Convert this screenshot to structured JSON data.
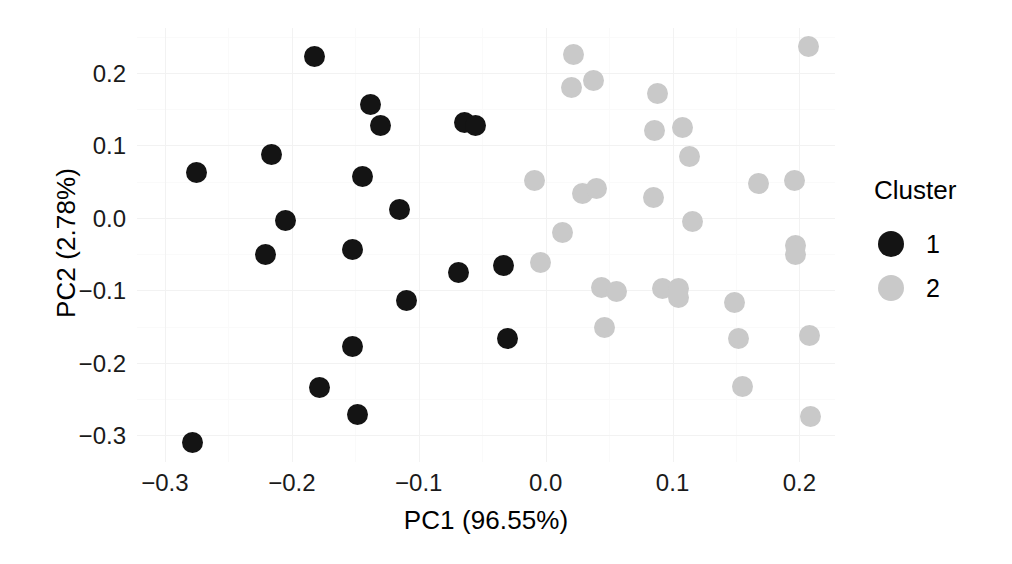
{
  "chart_data": {
    "type": "scatter",
    "title": "",
    "xlabel": "PC1 (96.55%)",
    "ylabel": "PC2 (2.78%)",
    "xlim": [
      -0.322,
      0.228
    ],
    "ylim": [
      -0.337,
      0.262
    ],
    "xticks": [
      "-0.3",
      "-0.2",
      "-0.1",
      "0.0",
      "0.1",
      "0.2"
    ],
    "xtick_values": [
      -0.3,
      -0.2,
      -0.1,
      0.0,
      0.1,
      0.2
    ],
    "yticks": [
      "0.2",
      "0.1",
      "0.0",
      "-0.1",
      "-0.2",
      "-0.3"
    ],
    "ytick_values": [
      0.2,
      0.1,
      0.0,
      -0.1,
      -0.2,
      -0.3
    ],
    "grid": true,
    "legend": {
      "title": "Cluster",
      "position": "right",
      "entries": [
        {
          "label": "1",
          "color": "#141414"
        },
        {
          "label": "2",
          "color": "#c9c9c9"
        }
      ]
    },
    "series": [
      {
        "name": "1",
        "color": "#141414",
        "points": [
          [
            -0.275,
            0.062
          ],
          [
            -0.216,
            0.088
          ],
          [
            -0.221,
            -0.051
          ],
          [
            -0.205,
            -0.004
          ],
          [
            -0.182,
            0.222
          ],
          [
            -0.178,
            -0.234
          ],
          [
            -0.152,
            -0.178
          ],
          [
            -0.148,
            -0.271
          ],
          [
            -0.152,
            -0.044
          ],
          [
            -0.138,
            0.157
          ],
          [
            -0.13,
            0.127
          ],
          [
            -0.144,
            0.057
          ],
          [
            -0.115,
            0.012
          ],
          [
            -0.11,
            -0.114
          ],
          [
            -0.064,
            0.132
          ],
          [
            -0.055,
            0.128
          ],
          [
            -0.069,
            -0.075
          ],
          [
            -0.033,
            -0.066
          ],
          [
            -0.03,
            -0.166
          ],
          [
            -0.278,
            -0.31
          ]
        ]
      },
      {
        "name": "2",
        "color": "#c9c9c9",
        "points": [
          [
            -0.009,
            0.051
          ],
          [
            -0.004,
            -0.061
          ],
          [
            0.013,
            -0.02
          ],
          [
            0.02,
            0.18
          ],
          [
            0.022,
            0.225
          ],
          [
            0.029,
            0.033
          ],
          [
            0.038,
            0.19
          ],
          [
            0.04,
            0.04
          ],
          [
            0.044,
            -0.096
          ],
          [
            0.056,
            -0.101
          ],
          [
            0.046,
            -0.152
          ],
          [
            0.088,
            0.172
          ],
          [
            0.086,
            0.12
          ],
          [
            0.085,
            0.028
          ],
          [
            0.092,
            -0.097
          ],
          [
            0.105,
            -0.098
          ],
          [
            0.105,
            -0.11
          ],
          [
            0.108,
            0.125
          ],
          [
            0.113,
            0.085
          ],
          [
            0.116,
            -0.005
          ],
          [
            0.149,
            -0.117
          ],
          [
            0.152,
            -0.167
          ],
          [
            0.155,
            -0.233
          ],
          [
            0.168,
            0.048
          ],
          [
            0.196,
            0.051
          ],
          [
            0.197,
            -0.038
          ],
          [
            0.197,
            -0.05
          ],
          [
            0.207,
            0.236
          ],
          [
            0.208,
            -0.163
          ],
          [
            0.209,
            -0.274
          ]
        ]
      }
    ]
  }
}
